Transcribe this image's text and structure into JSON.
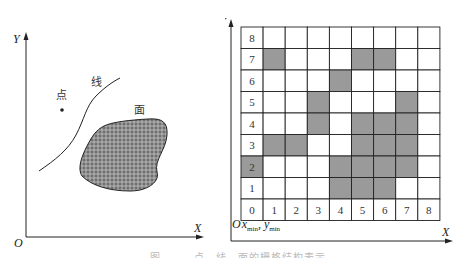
{
  "left_panel": {
    "axes": {
      "x_label": "X",
      "y_label": "Y",
      "origin_label": "O"
    },
    "labels": {
      "point": "点",
      "line": "线",
      "area": "面"
    }
  },
  "right_panel": {
    "axes": {
      "x_label": "X",
      "y_label": "Y",
      "origin_label": "O",
      "origin_sub": "x",
      "origin_sub_x": "min",
      "origin_sub_y": "min"
    },
    "grid": {
      "cols": 9,
      "rows": 9,
      "row_labels": [
        "8",
        "7",
        "6",
        "5",
        "4",
        "3",
        "2",
        "1",
        "0"
      ],
      "col_labels": [
        "0",
        "1",
        "2",
        "3",
        "4",
        "5",
        "6",
        "7",
        "8"
      ],
      "filled_color": "#9a9a9a",
      "filled_cells": [
        {
          "col": 1,
          "row": 7
        },
        {
          "col": 5,
          "row": 7
        },
        {
          "col": 6,
          "row": 7
        },
        {
          "col": 4,
          "row": 6
        },
        {
          "col": 3,
          "row": 5
        },
        {
          "col": 7,
          "row": 5
        },
        {
          "col": 3,
          "row": 4
        },
        {
          "col": 5,
          "row": 4
        },
        {
          "col": 6,
          "row": 4
        },
        {
          "col": 7,
          "row": 4
        },
        {
          "col": 1,
          "row": 3
        },
        {
          "col": 2,
          "row": 3
        },
        {
          "col": 5,
          "row": 3
        },
        {
          "col": 6,
          "row": 3
        },
        {
          "col": 7,
          "row": 3
        },
        {
          "col": 0,
          "row": 2
        },
        {
          "col": 4,
          "row": 2
        },
        {
          "col": 5,
          "row": 2
        },
        {
          "col": 6,
          "row": 2
        },
        {
          "col": 7,
          "row": 2
        },
        {
          "col": 4,
          "row": 1
        },
        {
          "col": 5,
          "row": 1
        },
        {
          "col": 6,
          "row": 1
        }
      ]
    }
  },
  "caption": "图　　　点、线、面的栅格结构表示"
}
